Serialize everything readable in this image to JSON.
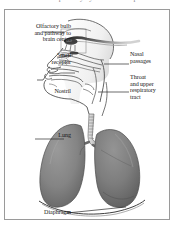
{
  "figure": {
    "clipped_title": "the human respiratory system and its parts",
    "kind": "anatomical-illustration"
  },
  "frame": {
    "border_color": "#9a9a9a",
    "background": "#ffffff"
  },
  "palette": {
    "ink": "#151515",
    "outline": "#3a3a3a",
    "leader_line": "#2b2b2b",
    "lung_fill": "#8a8a8a",
    "lung_fill_dark": "#6e6e6e",
    "lung_shadow": "#5a5a5a",
    "head_shading": "#d6d6d6",
    "trachea_fill": "#cfcfcf",
    "olfactory_dark": "#2a2a2a",
    "paper": "#ffffff"
  },
  "labels": {
    "olfactory": "Olfactory bulb\nand pathway to\nbrain center",
    "smell_receptor": "Smell\nreceptor",
    "nostril": "Nostril",
    "nasal_passages": "Nasal\npassages",
    "throat": "Throat\nand upper\nrespiratory\ntract",
    "lung": "Lung",
    "diaphragm": "Diaphragm"
  },
  "anatomy_parts": [
    {
      "name": "olfactory-bulb",
      "label": "Olfactory bulb and pathway to brain center",
      "side": "left",
      "has_leader": true,
      "has_detail_box": true
    },
    {
      "name": "smell-receptor",
      "label": "Smell receptor",
      "side": "left",
      "has_leader": true,
      "has_detail_box": false
    },
    {
      "name": "nostril",
      "label": "Nostril",
      "side": "left",
      "has_leader": true,
      "has_detail_box": false
    },
    {
      "name": "nasal-passages",
      "label": "Nasal passages",
      "side": "right",
      "has_leader": true,
      "has_detail_box": false
    },
    {
      "name": "throat",
      "label": "Throat and upper respiratory tract",
      "side": "right",
      "has_leader": true,
      "has_detail_box": false
    },
    {
      "name": "lung",
      "label": "Lung",
      "side": "left",
      "has_leader": true,
      "has_detail_box": false
    },
    {
      "name": "diaphragm",
      "label": "Diaphragm",
      "side": "left",
      "has_leader": true,
      "has_detail_box": false
    }
  ]
}
